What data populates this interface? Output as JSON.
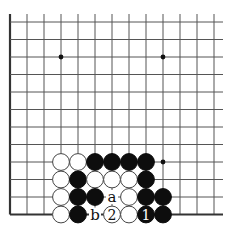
{
  "board": {
    "title": "Go problem diagram",
    "origin_x": 10,
    "origin_y": 22,
    "spacing_x": 17,
    "spacing_y": 17.5,
    "cols": 13,
    "rows": 12,
    "right_extent": 223,
    "edges": {
      "left": true,
      "bottom": true,
      "top": false,
      "right": false
    },
    "line_color": "#555555",
    "edge_color": "#333333",
    "star_points": [
      {
        "col": 3,
        "row": 2
      },
      {
        "col": 9,
        "row": 2
      },
      {
        "col": 9,
        "row": 8
      }
    ],
    "stones": [
      {
        "col": 3,
        "row": 8,
        "color": "white"
      },
      {
        "col": 4,
        "row": 8,
        "color": "white"
      },
      {
        "col": 5,
        "row": 8,
        "color": "black"
      },
      {
        "col": 6,
        "row": 8,
        "color": "black"
      },
      {
        "col": 7,
        "row": 8,
        "color": "black"
      },
      {
        "col": 8,
        "row": 8,
        "color": "black"
      },
      {
        "col": 3,
        "row": 9,
        "color": "white"
      },
      {
        "col": 4,
        "row": 9,
        "color": "black"
      },
      {
        "col": 5,
        "row": 9,
        "color": "white"
      },
      {
        "col": 6,
        "row": 9,
        "color": "white"
      },
      {
        "col": 7,
        "row": 9,
        "color": "white"
      },
      {
        "col": 8,
        "row": 9,
        "color": "black"
      },
      {
        "col": 3,
        "row": 10,
        "color": "white"
      },
      {
        "col": 4,
        "row": 10,
        "color": "black"
      },
      {
        "col": 5,
        "row": 10,
        "color": "black"
      },
      {
        "col": 7,
        "row": 10,
        "color": "white"
      },
      {
        "col": 8,
        "row": 10,
        "color": "black"
      },
      {
        "col": 9,
        "row": 10,
        "color": "black"
      },
      {
        "col": 3,
        "row": 11,
        "color": "white"
      },
      {
        "col": 4,
        "row": 11,
        "color": "black"
      },
      {
        "col": 6,
        "row": 11,
        "color": "white",
        "label": "2"
      },
      {
        "col": 7,
        "row": 11,
        "color": "white"
      },
      {
        "col": 8,
        "row": 11,
        "color": "black",
        "label": "1"
      },
      {
        "col": 9,
        "row": 11,
        "color": "black"
      }
    ],
    "markers": [
      {
        "col": 6,
        "row": 10,
        "label": "a"
      },
      {
        "col": 5,
        "row": 11,
        "label": "b"
      }
    ]
  }
}
